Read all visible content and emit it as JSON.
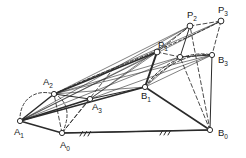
{
  "figure": {
    "background_color": "#ffffff",
    "ink_color": "#2b2b2b",
    "node_fill": "#ffffff",
    "width": 246,
    "height": 158
  },
  "labels": {
    "a0": {
      "base": "A",
      "sub": "0",
      "x": 60,
      "y": 148
    },
    "a1": {
      "base": "A",
      "sub": "1",
      "x": 14,
      "y": 135
    },
    "a2": {
      "base": "A",
      "sub": "2",
      "x": 43,
      "y": 85
    },
    "a3": {
      "base": "A",
      "sub": "3",
      "x": 92,
      "y": 110
    },
    "b0": {
      "base": "B",
      "sub": "0",
      "x": 218,
      "y": 136
    },
    "b1": {
      "base": "B",
      "sub": "1",
      "x": 141,
      "y": 99
    },
    "b3": {
      "base": "B",
      "sub": "3",
      "x": 218,
      "y": 63
    },
    "p1": {
      "base": "P",
      "sub": "1",
      "x": 158,
      "y": 48
    },
    "p2": {
      "base": "P",
      "sub": "2",
      "x": 187,
      "y": 18
    },
    "p3": {
      "base": "P",
      "sub": "3",
      "x": 218,
      "y": 13
    }
  },
  "nodes": [
    {
      "name": "node-a0",
      "x": 62,
      "y": 133,
      "r": 2.6
    },
    {
      "name": "node-a1",
      "x": 20,
      "y": 121,
      "r": 2.6
    },
    {
      "name": "node-a2",
      "x": 54,
      "y": 94,
      "r": 2.6
    },
    {
      "name": "node-a3",
      "x": 90,
      "y": 99,
      "r": 2.6
    },
    {
      "name": "node-b0",
      "x": 210,
      "y": 130,
      "r": 2.6
    },
    {
      "name": "node-b1",
      "x": 145,
      "y": 87,
      "r": 2.6
    },
    {
      "name": "node-b2",
      "x": 180,
      "y": 57,
      "r": 2.6
    },
    {
      "name": "node-b3",
      "x": 212,
      "y": 55,
      "r": 2.6
    },
    {
      "name": "node-p1",
      "x": 157,
      "y": 52,
      "r": 2.9
    },
    {
      "name": "node-p2",
      "x": 190,
      "y": 26,
      "r": 2.9
    },
    {
      "name": "node-p3",
      "x": 221,
      "y": 21,
      "r": 2.9
    }
  ],
  "solid_links": [
    {
      "name": "link-ground-a0-b0",
      "from": [
        62,
        133
      ],
      "to": [
        210,
        130
      ],
      "w": 1.5
    },
    {
      "name": "link-a1-a0",
      "from": [
        20,
        121
      ],
      "to": [
        62,
        133
      ],
      "w": 1.5
    },
    {
      "name": "link-a0-b0-frame",
      "from": [
        62,
        133
      ],
      "to": [
        210,
        130
      ],
      "w": 1.2
    },
    {
      "name": "link-b1-b0",
      "from": [
        145,
        87
      ],
      "to": [
        210,
        130
      ],
      "w": 1.6
    },
    {
      "name": "link-b1-p1",
      "from": [
        145,
        87
      ],
      "to": [
        157,
        52
      ],
      "w": 2.0
    },
    {
      "name": "link-a1-a2",
      "from": [
        20,
        121
      ],
      "to": [
        54,
        94
      ],
      "w": 1.5
    },
    {
      "name": "link-a1-a3",
      "from": [
        20,
        121
      ],
      "to": [
        90,
        99
      ],
      "w": 1.5
    },
    {
      "name": "link-a1-b1",
      "from": [
        20,
        121
      ],
      "to": [
        145,
        87
      ],
      "w": 1.5
    },
    {
      "name": "link-a2-p1-coupler",
      "from": [
        54,
        94
      ],
      "to": [
        157,
        52
      ],
      "w": 1.5
    },
    {
      "name": "link-a3-b1",
      "from": [
        90,
        99
      ],
      "to": [
        145,
        87
      ],
      "w": 1.2
    },
    {
      "name": "link-a2-a3",
      "from": [
        54,
        94
      ],
      "to": [
        90,
        99
      ],
      "w": 1.1
    },
    {
      "name": "link-p2-b2",
      "from": [
        190,
        26
      ],
      "to": [
        180,
        57
      ],
      "w": 1.0
    },
    {
      "name": "link-b2-b3",
      "from": [
        180,
        57
      ],
      "to": [
        212,
        55
      ],
      "w": 1.0
    },
    {
      "name": "link-b3-b0",
      "from": [
        212,
        55
      ],
      "to": [
        210,
        130
      ],
      "w": 1.0
    }
  ],
  "thin_lines": [
    {
      "name": "sightline-a1-p2",
      "from": [
        20,
        121
      ],
      "to": [
        190,
        26
      ]
    },
    {
      "name": "sightline-a1-p3",
      "from": [
        20,
        121
      ],
      "to": [
        221,
        21
      ]
    },
    {
      "name": "sightline-a2-p2",
      "from": [
        54,
        94
      ],
      "to": [
        190,
        26
      ]
    },
    {
      "name": "sightline-a2-p3",
      "from": [
        54,
        94
      ],
      "to": [
        221,
        21
      ]
    },
    {
      "name": "sightline-a3-p2",
      "from": [
        90,
        99
      ],
      "to": [
        190,
        26
      ]
    },
    {
      "name": "sightline-a3-p1",
      "from": [
        90,
        99
      ],
      "to": [
        157,
        52
      ]
    },
    {
      "name": "sightline-a1-p1",
      "from": [
        20,
        121
      ],
      "to": [
        157,
        52
      ]
    },
    {
      "name": "sightline-a2-b2",
      "from": [
        54,
        94
      ],
      "to": [
        180,
        57
      ]
    },
    {
      "name": "sightline-a3-b3",
      "from": [
        90,
        99
      ],
      "to": [
        212,
        55
      ]
    },
    {
      "name": "sightline-a2-b3",
      "from": [
        54,
        94
      ],
      "to": [
        212,
        55
      ]
    },
    {
      "name": "sightline-a1-b2",
      "from": [
        20,
        121
      ],
      "to": [
        180,
        57
      ]
    },
    {
      "name": "sightline-b1-b2",
      "from": [
        145,
        87
      ],
      "to": [
        180,
        57
      ]
    },
    {
      "name": "sightline-b1-b3",
      "from": [
        145,
        87
      ],
      "to": [
        212,
        55
      ]
    },
    {
      "name": "sightline-a2-b1",
      "from": [
        54,
        94
      ],
      "to": [
        145,
        87
      ]
    }
  ],
  "dashed_lines": [
    {
      "name": "dashed-a0-a2",
      "from": [
        62,
        133
      ],
      "to": [
        54,
        94
      ]
    },
    {
      "name": "dashed-a0-a3",
      "from": [
        62,
        133
      ],
      "to": [
        90,
        99
      ]
    },
    {
      "name": "dashed-a0-p1-ray",
      "from": [
        62,
        133
      ],
      "to": [
        114,
        68
      ]
    },
    {
      "name": "dashed-p1-b2",
      "from": [
        157,
        52
      ],
      "to": [
        180,
        57
      ]
    },
    {
      "name": "dashed-p3-b3",
      "from": [
        221,
        21
      ],
      "to": [
        212,
        55
      ]
    },
    {
      "name": "dashed-b0-p2",
      "from": [
        210,
        130
      ],
      "to": [
        190,
        26
      ]
    },
    {
      "name": "dashed-b0-b2",
      "from": [
        210,
        130
      ],
      "to": [
        180,
        57
      ]
    },
    {
      "name": "dashed-p1-p2",
      "from": [
        157,
        52
      ],
      "to": [
        190,
        26
      ]
    },
    {
      "name": "dashed-p2-p3",
      "from": [
        190,
        26
      ],
      "to": [
        221,
        21
      ]
    }
  ],
  "arcs": [
    {
      "name": "arc-a1-a2-a0-circle",
      "d": "M 20,121 C 19,101 34,88 54,94"
    },
    {
      "name": "arc-a2-a0-lower",
      "d": "M 54,94 C 66,99 72,114 62,133"
    },
    {
      "name": "arc-coupler-p1-p3",
      "d": "M 145,87 C 162,62 190,50 212,55"
    },
    {
      "name": "arc-coupler-upper",
      "d": "M 54,94 C 100,72 165,50 221,21"
    },
    {
      "name": "arc-b2-b3-bow",
      "d": "M 145,87 C 165,64 192,52 212,55"
    }
  ],
  "ground_hatches": [
    {
      "name": "ground-hatch-left",
      "x": 80,
      "y": 132
    },
    {
      "name": "ground-hatch-right",
      "x": 160,
      "y": 131
    }
  ]
}
